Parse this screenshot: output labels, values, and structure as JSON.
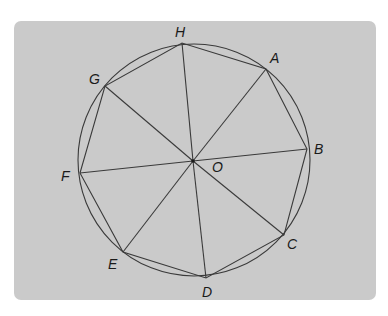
{
  "figure": {
    "colors": {
      "panel_background": "#cacaca",
      "stroke": "#3a3a3a",
      "label": "#1a1a1a"
    },
    "circle": {
      "cx": 194,
      "cy": 160,
      "r": 116
    },
    "center": {
      "name": "O",
      "label": "O",
      "x": 193,
      "y": 161,
      "label_x": 212,
      "label_y": 172
    },
    "vertices": [
      {
        "name": "A",
        "label": "A",
        "x": 266,
        "y": 69,
        "label_x": 270,
        "label_y": 63
      },
      {
        "name": "B",
        "label": "B",
        "x": 307,
        "y": 149,
        "label_x": 314,
        "label_y": 154
      },
      {
        "name": "C",
        "label": "C",
        "x": 284,
        "y": 235,
        "label_x": 287,
        "label_y": 249
      },
      {
        "name": "D",
        "label": "D",
        "x": 206,
        "y": 278,
        "label_x": 202,
        "label_y": 297
      },
      {
        "name": "E",
        "label": "E",
        "x": 123,
        "y": 252,
        "label_x": 108,
        "label_y": 269
      },
      {
        "name": "F",
        "label": "F",
        "x": 80,
        "y": 173,
        "label_x": 61,
        "label_y": 181
      },
      {
        "name": "G",
        "label": "G",
        "x": 105,
        "y": 86,
        "label_x": 89,
        "label_y": 84
      },
      {
        "name": "H",
        "label": "H",
        "x": 182,
        "y": 43,
        "label_x": 175,
        "label_y": 37
      }
    ]
  }
}
